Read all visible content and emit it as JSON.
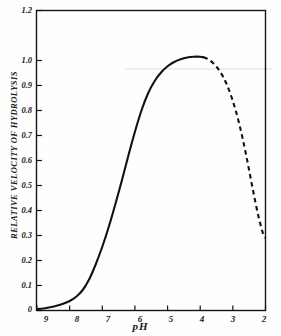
{
  "figure": {
    "background_color": "#fefefe",
    "ink_color": "#141414"
  },
  "chart_data": {
    "type": "line",
    "title": "",
    "xlabel": "pH",
    "ylabel": "RELATIVE VELOCITY OF HYDROLYSIS",
    "xlim": [
      9,
      2
    ],
    "ylim": [
      0,
      1.2
    ],
    "x_axis_reversed": true,
    "grid": false,
    "legend": null,
    "xticks": [
      9,
      8,
      7,
      6,
      5,
      4,
      3,
      2
    ],
    "xtick_labels": [
      "9",
      "8",
      "7",
      "6",
      "5",
      "4",
      "3",
      "2"
    ],
    "yticks": [
      0,
      0.1,
      0.2,
      0.3,
      0.4,
      0.5,
      0.6,
      0.7,
      0.8,
      0.9,
      1.0,
      1.2
    ],
    "ytick_labels": [
      "0",
      "0.1",
      "0.2",
      "0.3",
      "0.4",
      "0.5",
      "0.6",
      "0.7",
      "0.8",
      "0.9",
      "1.0",
      "1.2"
    ],
    "series": [
      {
        "name": "relative velocity of hydrolysis (measured)",
        "style": "solid",
        "x": [
          9.0,
          8.8,
          8.6,
          8.4,
          8.2,
          8.0,
          7.8,
          7.6,
          7.4,
          7.2,
          7.0,
          6.8,
          6.6,
          6.4,
          6.2,
          6.0,
          5.8,
          5.6,
          5.4,
          5.2,
          5.0,
          4.8,
          4.6,
          4.4,
          4.2,
          4.0,
          3.9
        ],
        "y": [
          0.005,
          0.008,
          0.013,
          0.019,
          0.027,
          0.038,
          0.055,
          0.082,
          0.125,
          0.185,
          0.255,
          0.335,
          0.425,
          0.52,
          0.62,
          0.715,
          0.8,
          0.868,
          0.917,
          0.952,
          0.977,
          0.994,
          1.005,
          1.012,
          1.015,
          1.015,
          1.013
        ]
      },
      {
        "name": "relative velocity of hydrolysis (extrapolated)",
        "style": "dashed",
        "x": [
          3.9,
          3.8,
          3.7,
          3.6,
          3.5,
          3.4,
          3.3,
          3.2,
          3.1,
          3.0,
          2.9,
          2.8,
          2.7,
          2.6,
          2.5,
          2.4,
          2.3,
          2.2,
          2.1,
          2.05,
          2.0
        ],
        "y": [
          1.013,
          1.008,
          1.0,
          0.989,
          0.975,
          0.957,
          0.935,
          0.908,
          0.876,
          0.838,
          0.794,
          0.744,
          0.688,
          0.626,
          0.56,
          0.492,
          0.427,
          0.368,
          0.318,
          0.3,
          0.29
        ]
      }
    ],
    "annotations": [
      {
        "name": "peak",
        "x": 4.1,
        "y": 1.015,
        "text": ""
      },
      {
        "name": "solid-to-dashed-transition",
        "x": 3.9,
        "y": 1.013,
        "text": ""
      }
    ]
  },
  "axes": {
    "x_title": "pH",
    "y_title": "RELATIVE VELOCITY OF HYDROLYSIS"
  }
}
